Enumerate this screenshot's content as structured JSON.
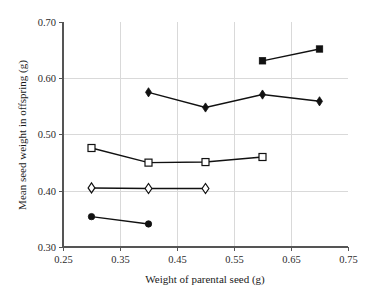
{
  "chart_data": {
    "type": "scatter",
    "title": "",
    "xlabel": "Weight of parental seed (g)",
    "ylabel": "Mean seed weight in offspring (g)",
    "xlim": [
      0.25,
      0.75
    ],
    "ylim": [
      0.3,
      0.7
    ],
    "xticks": [
      0.25,
      0.35,
      0.45,
      0.55,
      0.65,
      0.75
    ],
    "xtick_labels": [
      "0.25",
      "0.35",
      "0.45",
      "0.55",
      "0.65",
      "0.75"
    ],
    "yticks": [
      0.3,
      0.4,
      0.5,
      0.6,
      0.7
    ],
    "ytick_labels": [
      "0.30",
      "0.40",
      "0.50",
      "0.60",
      "0.70"
    ],
    "grid": "horizontal-and-vertical-light",
    "legend": "none",
    "line_color": "#111111",
    "series": [
      {
        "name": "filled-circle-series",
        "marker": "filled-circle",
        "x": [
          0.3,
          0.4
        ],
        "values": [
          0.354,
          0.341
        ]
      },
      {
        "name": "open-diamond-series",
        "marker": "open-diamond",
        "x": [
          0.3,
          0.4,
          0.5
        ],
        "values": [
          0.405,
          0.404,
          0.404
        ]
      },
      {
        "name": "open-square-series",
        "marker": "open-square",
        "x": [
          0.3,
          0.4,
          0.5,
          0.6
        ],
        "values": [
          0.476,
          0.45,
          0.451,
          0.46
        ]
      },
      {
        "name": "filled-diamond-series",
        "marker": "filled-diamond",
        "x": [
          0.4,
          0.5,
          0.6,
          0.7
        ],
        "values": [
          0.575,
          0.548,
          0.571,
          0.559
        ]
      },
      {
        "name": "filled-square-series",
        "marker": "filled-square",
        "x": [
          0.6,
          0.7
        ],
        "values": [
          0.631,
          0.652
        ]
      }
    ]
  }
}
